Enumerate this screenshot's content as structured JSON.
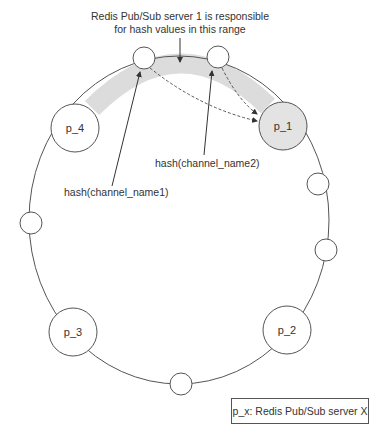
{
  "diagram": {
    "annotation": {
      "line1": "Redis Pub/Sub server 1 is responsible",
      "line2": "for hash values in this range"
    },
    "servers": [
      {
        "id": "p_1",
        "label": "p_1",
        "highlighted": true
      },
      {
        "id": "p_2",
        "label": "p_2",
        "highlighted": false
      },
      {
        "id": "p_3",
        "label": "p_3",
        "highlighted": false
      },
      {
        "id": "p_4",
        "label": "p_4",
        "highlighted": false
      }
    ],
    "hash_labels": {
      "channel1": "hash(channel_name1)",
      "channel2": "hash(channel_name2)"
    },
    "legend": "p_x: Redis Pub/Sub server X",
    "colors": {
      "ring": "#555555",
      "range_band": "#dcdcdc",
      "highlight_fill": "#e3e3e3",
      "node_fill": "#ffffff",
      "text": "#333333"
    }
  }
}
